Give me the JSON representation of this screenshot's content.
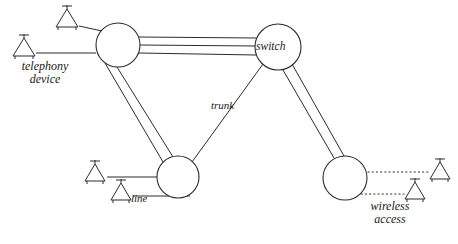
{
  "diagram": {
    "stroke_color": "#2b2b2b",
    "background_color": "#ffffff",
    "nodes": [
      {
        "id": "left-switch-node",
        "name": "left switch node",
        "label": "",
        "cx": 118,
        "cy": 45,
        "r": 22
      },
      {
        "id": "switch-node",
        "name": "switch node",
        "label": "switch",
        "cx": 278,
        "cy": 47,
        "r": 23
      },
      {
        "id": "lower-switch-node",
        "name": "lower switch node",
        "label": "",
        "cx": 178,
        "cy": 177,
        "r": 21
      },
      {
        "id": "wireless-access-node",
        "name": "wireless access node",
        "label": "",
        "cx": 345,
        "cy": 178,
        "r": 22
      }
    ],
    "edges": [
      {
        "id": "edge-left-to-switch",
        "label": "",
        "from": "left-switch-node",
        "to": "switch-node",
        "line_count": 3,
        "style": "solid"
      },
      {
        "id": "edge-left-to-lower",
        "label": "",
        "from": "left-switch-node",
        "to": "lower-switch-node",
        "line_count": 2,
        "style": "solid"
      },
      {
        "id": "edge-switch-to-lower",
        "label": "trunk",
        "from": "switch-node",
        "to": "lower-switch-node",
        "line_count": 1,
        "style": "solid"
      },
      {
        "id": "edge-switch-to-wireless",
        "label": "",
        "from": "switch-node",
        "to": "wireless-access-node",
        "line_count": 2,
        "style": "solid"
      }
    ],
    "labels": {
      "switch": "switch",
      "trunk": "trunk",
      "line": "line",
      "telephony_device_line1": "telephony",
      "telephony_device_line2": "device",
      "wireless_access_line1": "wireless",
      "wireless_access_line2": "access"
    },
    "terminals": [
      {
        "id": "telephony-device-top",
        "icon": "telephony-device-icon",
        "x": 67,
        "y": 18,
        "attached_to": "left-switch-node",
        "link_style": "solid",
        "link_label": ""
      },
      {
        "id": "telephony-device-bottom",
        "icon": "telephony-device-icon",
        "x": 24,
        "y": 47,
        "attached_to": "left-switch-node",
        "link_style": "solid",
        "link_label": ""
      },
      {
        "id": "line-device-upper",
        "icon": "telephony-device-icon",
        "x": 95,
        "y": 172,
        "attached_to": "lower-switch-node",
        "link_style": "solid",
        "link_label": ""
      },
      {
        "id": "line-device-lower",
        "icon": "telephony-device-icon",
        "x": 121,
        "y": 191,
        "attached_to": "lower-switch-node",
        "link_style": "solid",
        "link_label": "line"
      },
      {
        "id": "wireless-device-upper",
        "icon": "telephony-device-icon",
        "x": 440,
        "y": 170,
        "attached_to": "wireless-access-node",
        "link_style": "dotted",
        "link_label": ""
      },
      {
        "id": "wireless-device-lower",
        "icon": "telephony-device-icon",
        "x": 415,
        "y": 190,
        "attached_to": "wireless-access-node",
        "link_style": "dotted",
        "link_label": ""
      }
    ]
  }
}
